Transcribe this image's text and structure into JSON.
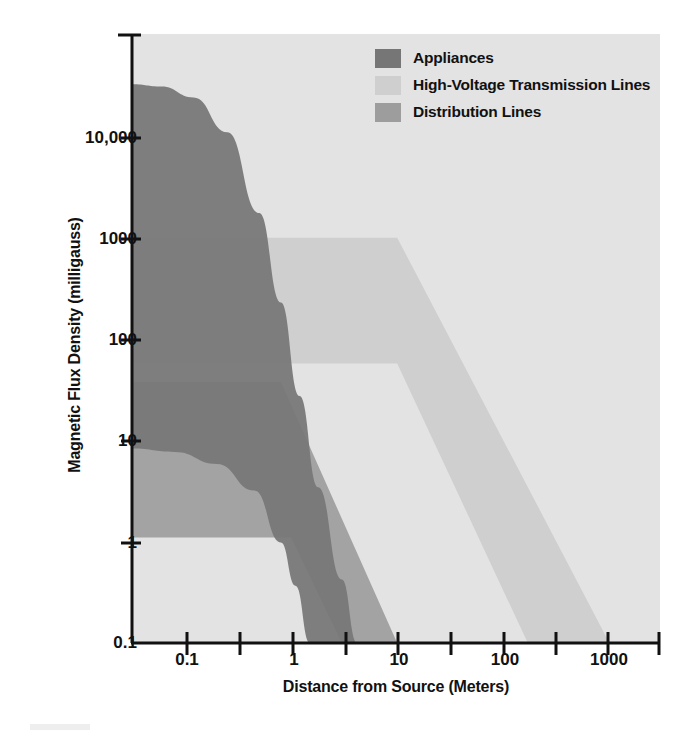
{
  "chart_data": {
    "type": "area",
    "title": "",
    "xlabel": "Distance from Source (Meters)",
    "ylabel": "Magnetic Flux Density (milligauss)",
    "x_scale": "log",
    "y_scale": "log",
    "xlim": [
      0.0316,
      3000
    ],
    "ylim": [
      0.1,
      60000
    ],
    "xticks": [
      "0.1",
      "1",
      "10",
      "100",
      "1000"
    ],
    "xtick_values": [
      0.1,
      1,
      10,
      100,
      1000
    ],
    "yticks": [
      "10,000",
      "1000",
      "100",
      "10",
      "1",
      "0.1"
    ],
    "ytick_values": [
      10000,
      1000,
      100,
      10,
      1,
      0.1
    ],
    "grid": false,
    "legend_position": "top-right",
    "colors": {
      "background": "#e3e3e3",
      "appliances": "#767676",
      "high_voltage": "#cfcfcf",
      "distribution": "#9d9d9d",
      "axis": "#111111"
    },
    "series": [
      {
        "name": "Appliances",
        "color": "#767676",
        "upper_bound": [
          {
            "x": 0.0316,
            "y": 20000
          },
          {
            "x": 0.06,
            "y": 19000
          },
          {
            "x": 0.12,
            "y": 15000
          },
          {
            "x": 0.25,
            "y": 7000
          },
          {
            "x": 0.5,
            "y": 1200
          },
          {
            "x": 0.8,
            "y": 170
          },
          {
            "x": 1.2,
            "y": 22
          },
          {
            "x": 1.8,
            "y": 3.0
          },
          {
            "x": 3.0,
            "y": 0.4
          },
          {
            "x": 4.2,
            "y": 0.1
          }
        ],
        "lower_bound": [
          {
            "x": 0.0316,
            "y": 7
          },
          {
            "x": 0.08,
            "y": 6.5
          },
          {
            "x": 0.2,
            "y": 5.0
          },
          {
            "x": 0.45,
            "y": 2.8
          },
          {
            "x": 0.8,
            "y": 0.9
          },
          {
            "x": 1.1,
            "y": 0.35
          },
          {
            "x": 1.5,
            "y": 0.1
          }
        ]
      },
      {
        "name": "High-Voltage Transmission Lines",
        "color": "#cfcfcf",
        "upper_bound": [
          {
            "x": 0.0316,
            "y": 700
          },
          {
            "x": 10,
            "y": 700
          },
          {
            "x": 1000,
            "y": 0.1
          }
        ],
        "lower_bound": [
          {
            "x": 0.0316,
            "y": 45
          },
          {
            "x": 10,
            "y": 45
          },
          {
            "x": 170,
            "y": 0.1
          }
        ]
      },
      {
        "name": "Distribution Lines",
        "color": "#9d9d9d",
        "upper_bound": [
          {
            "x": 0.0316,
            "y": 30
          },
          {
            "x": 0.8,
            "y": 30
          },
          {
            "x": 10,
            "y": 0.1
          }
        ],
        "lower_bound": [
          {
            "x": 0.0316,
            "y": 1.0
          },
          {
            "x": 1.0,
            "y": 1.0
          },
          {
            "x": 3.0,
            "y": 0.1
          }
        ]
      }
    ]
  },
  "legend": {
    "items": [
      {
        "label": "Appliances",
        "color": "#767676"
      },
      {
        "label": "High-Voltage Transmission Lines",
        "color": "#cfcfcf"
      },
      {
        "label": "Distribution Lines",
        "color": "#9d9d9d"
      }
    ]
  },
  "axes": {
    "y_title": "Magnetic Flux Density (milligauss)",
    "x_title": "Distance from Source (Meters)",
    "y_labels": [
      "10,000",
      "1000",
      "100",
      "10",
      "1",
      "0.1"
    ],
    "x_labels": [
      "0.1",
      "1",
      "10",
      "100",
      "1000"
    ]
  }
}
